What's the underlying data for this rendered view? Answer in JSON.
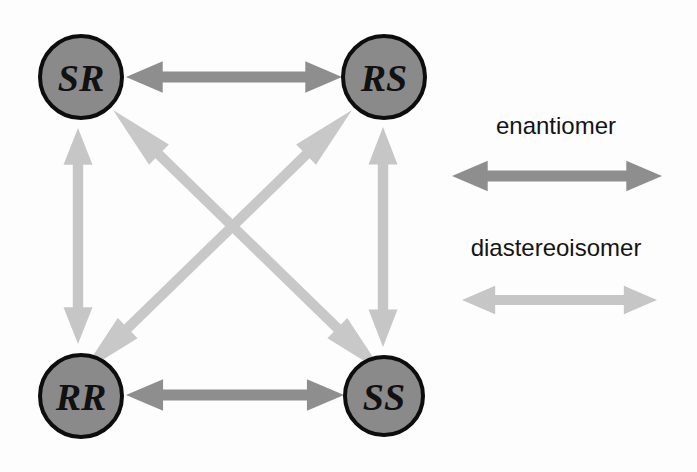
{
  "diagram": {
    "background_color": "#fdfdfd",
    "node_fill": "#8a8a8a",
    "node_stroke": "#0d0d0d",
    "enantiomer_color": "#8e8e8e",
    "diastereoisomer_color": "#c6c6c6",
    "nodes": [
      {
        "id": "sr",
        "label": "SR",
        "cx": 81,
        "cy": 77,
        "r": 41
      },
      {
        "id": "rs",
        "label": "RS",
        "cx": 384,
        "cy": 77,
        "r": 41
      },
      {
        "id": "rr",
        "label": "RR",
        "cx": 81,
        "cy": 396,
        "r": 41
      },
      {
        "id": "ss",
        "label": "SS",
        "cx": 384,
        "cy": 396,
        "r": 39
      }
    ],
    "connections": [
      {
        "id": "sr-rs",
        "from": "SR",
        "to": "RS",
        "relationship": "enantiomer",
        "orientation": "horizontal"
      },
      {
        "id": "rr-ss",
        "from": "RR",
        "to": "SS",
        "relationship": "enantiomer",
        "orientation": "horizontal"
      },
      {
        "id": "sr-rr",
        "from": "SR",
        "to": "RR",
        "relationship": "diastereoisomer",
        "orientation": "vertical"
      },
      {
        "id": "rs-ss",
        "from": "RS",
        "to": "SS",
        "relationship": "diastereoisomer",
        "orientation": "vertical"
      },
      {
        "id": "sr-ss",
        "from": "SR",
        "to": "SS",
        "relationship": "diastereoisomer",
        "orientation": "diagonal"
      },
      {
        "id": "rs-rr",
        "from": "RS",
        "to": "RR",
        "relationship": "diastereoisomer",
        "orientation": "diagonal"
      }
    ]
  },
  "legend": {
    "items": [
      {
        "id": "enantiomer",
        "label": "enantiomer",
        "color": "#8e8e8e"
      },
      {
        "id": "diastereoisomer",
        "label": "diastereoisomer",
        "color": "#c6c6c6"
      }
    ]
  }
}
